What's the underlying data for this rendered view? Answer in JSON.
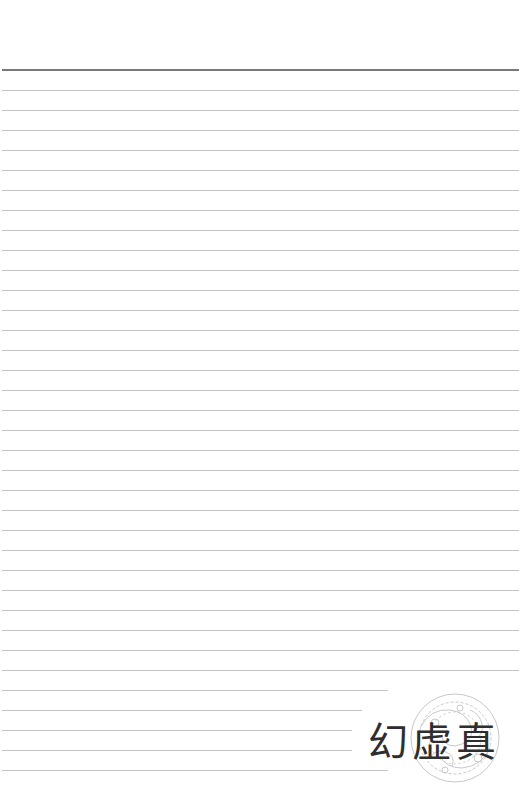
{
  "page": {
    "type": "lined-notebook-page",
    "background": "#ffffff",
    "top_rule_color": "#7a7a7a",
    "line_color": "#c4c4c4",
    "line_count": 35,
    "line_spacing_px": 20
  },
  "logo": {
    "text": "幻虚真",
    "color": "#2e2e2e",
    "ornament": "decorative-circular-seal"
  }
}
